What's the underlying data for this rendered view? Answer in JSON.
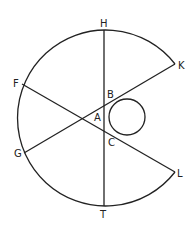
{
  "diagram": {
    "type": "geometry",
    "stroke_color": "#222222",
    "background": "#ffffff",
    "points": {
      "H": {
        "label": "H",
        "x": 104,
        "y": 30
      },
      "T": {
        "label": "T",
        "x": 104,
        "y": 206
      },
      "K": {
        "label": "K",
        "x": 175,
        "y": 64
      },
      "L": {
        "label": "L",
        "x": 175,
        "y": 172
      },
      "F": {
        "label": "F",
        "x": 22,
        "y": 84
      },
      "G": {
        "label": "G",
        "x": 24,
        "y": 153
      },
      "A": {
        "label": "A",
        "x": 80,
        "y": 118
      },
      "B": {
        "label": "B",
        "x": 110,
        "y": 100
      },
      "C": {
        "label": "C",
        "x": 110,
        "y": 136
      }
    },
    "segments": [
      {
        "from": "H",
        "to": "T"
      },
      {
        "from": "F",
        "to": "L"
      },
      {
        "from": "G",
        "to": "K"
      }
    ],
    "large_arc": {
      "center_x": 104,
      "center_y": 118,
      "radius": 88,
      "from": "K",
      "to": "L",
      "direction": "counterclockwise-through-H-F-G-T"
    },
    "small_circle": {
      "center_x": 127,
      "center_y": 117,
      "radius": 18,
      "tangent_points": [
        "B",
        "C"
      ]
    }
  }
}
